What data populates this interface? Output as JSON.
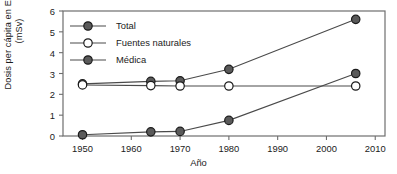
{
  "chart_data": {
    "type": "line",
    "title": "",
    "xlabel": "Año",
    "ylabel_line1": "Dosis per cápita en EE. UU.",
    "ylabel_line2": "(mSv)",
    "x": [
      1950,
      1964,
      1970,
      1980,
      2006
    ],
    "xlim": [
      1946,
      2012
    ],
    "ylim": [
      0,
      6
    ],
    "xticks": [
      1950,
      1960,
      1970,
      1980,
      1990,
      2000,
      2010
    ],
    "xticklabels": [
      "1950",
      "1960",
      "1970",
      "1980",
      "1990",
      "2000",
      "2010"
    ],
    "yticks": [
      0,
      1,
      2,
      3,
      4,
      5,
      6
    ],
    "yticklabels": [
      "0",
      "1",
      "2",
      "3",
      "4",
      "5",
      "6"
    ],
    "grid": false,
    "legend_position": "upper left",
    "series": [
      {
        "name": "Total",
        "marker": "filled-circle",
        "color": "#5a5a5a",
        "edge_color": "#1b1b1b",
        "values": [
          2.5,
          2.62,
          2.65,
          3.2,
          5.6
        ]
      },
      {
        "name": "Fuentes naturales",
        "marker": "open-circle",
        "color": "#ffffff",
        "edge_color": "#1b1b1b",
        "values": [
          2.45,
          2.42,
          2.4,
          2.4,
          2.4
        ]
      },
      {
        "name": "Médica",
        "marker": "filled-circle",
        "color": "#5a5a5a",
        "edge_color": "#1b1b1b",
        "values": [
          0.06,
          0.2,
          0.22,
          0.75,
          3.0
        ]
      }
    ]
  },
  "legend": {
    "items": [
      {
        "label": "Total"
      },
      {
        "label": "Fuentes naturales"
      },
      {
        "label": "Médica"
      }
    ]
  },
  "colors": {
    "axis": "#6e6e6e",
    "text": "#1b1b1b",
    "line": "#4a4a4a",
    "marker_fill": "#5a5a5a",
    "marker_open": "#ffffff",
    "marker_edge": "#1b1b1b"
  }
}
